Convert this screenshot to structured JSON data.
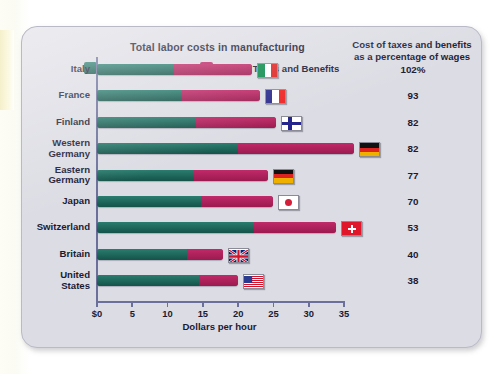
{
  "chart_title": "Total labor costs in manufacturing",
  "right_column_header": "Cost of taxes and benefits as a percentage of wages",
  "legend": [
    {
      "label": "Direct Pay",
      "color": "#1c6a5e",
      "key": "direct_pay"
    },
    {
      "label": "Payroll Taxes and Benefits",
      "color": "#b0215c",
      "key": "payroll_taxes"
    }
  ],
  "axis": {
    "xlabel": "Dollars per hour",
    "ticks": [
      "$0",
      "5",
      "10",
      "15",
      "20",
      "25",
      "30",
      "35"
    ],
    "tick_values": [
      0,
      5,
      10,
      15,
      20,
      25,
      30,
      35
    ],
    "min": 0,
    "max": 35
  },
  "chart_data": {
    "type": "bar",
    "orientation": "horizontal",
    "stacked": true,
    "title": "Total labor costs in manufacturing",
    "xlabel": "Dollars per hour",
    "ylabel": "",
    "xlim": [
      0,
      35
    ],
    "grid": false,
    "legend_position": "top",
    "categories": [
      "Italy",
      "France",
      "Finland",
      "Western Germany",
      "Eastern Germany",
      "Japan",
      "Switzerland",
      "Britain",
      "United States"
    ],
    "series": [
      {
        "name": "Direct Pay",
        "color": "#1c6a5e",
        "values": [
          10.9,
          12.0,
          14.0,
          20.0,
          13.7,
          14.7,
          22.2,
          12.8,
          14.5
        ]
      },
      {
        "name": "Payroll Taxes and Benefits",
        "color": "#b0215c",
        "values": [
          11.1,
          11.1,
          11.4,
          16.4,
          10.5,
          10.3,
          11.7,
          5.1,
          5.5
        ]
      }
    ],
    "totals": [
      22.0,
      23.1,
      25.4,
      36.4,
      24.2,
      25.0,
      33.9,
      17.9,
      20.0
    ],
    "annotations": {
      "label": "Cost of taxes and benefits as a percentage of wages",
      "values": [
        "102%",
        "93",
        "82",
        "82",
        "77",
        "70",
        "53",
        "40",
        "38"
      ]
    }
  },
  "rows": [
    {
      "country": "Italy",
      "country_lines": [
        "Italy"
      ],
      "direct": 10.9,
      "tax": 11.1,
      "pct": "102%",
      "flag": "italy"
    },
    {
      "country": "France",
      "country_lines": [
        "France"
      ],
      "direct": 12.0,
      "tax": 11.1,
      "pct": "93",
      "flag": "france"
    },
    {
      "country": "Finland",
      "country_lines": [
        "Finland"
      ],
      "direct": 14.0,
      "tax": 11.4,
      "pct": "82",
      "flag": "finland"
    },
    {
      "country": "Western Germany",
      "country_lines": [
        "Western",
        "Germany"
      ],
      "direct": 20.0,
      "tax": 16.4,
      "pct": "82",
      "flag": "germany"
    },
    {
      "country": "Eastern Germany",
      "country_lines": [
        "Eastern",
        "Germany"
      ],
      "direct": 13.7,
      "tax": 10.5,
      "pct": "77",
      "flag": "germany"
    },
    {
      "country": "Japan",
      "country_lines": [
        "Japan"
      ],
      "direct": 14.7,
      "tax": 10.3,
      "pct": "70",
      "flag": "japan"
    },
    {
      "country": "Switzerland",
      "country_lines": [
        "Switzerland"
      ],
      "direct": 22.2,
      "tax": 11.7,
      "pct": "53",
      "flag": "switzerland"
    },
    {
      "country": "Britain",
      "country_lines": [
        "Britain"
      ],
      "direct": 12.8,
      "tax": 5.1,
      "pct": "40",
      "flag": "uk"
    },
    {
      "country": "United States",
      "country_lines": [
        "United",
        "States"
      ],
      "direct": 14.5,
      "tax": 5.5,
      "pct": "38",
      "flag": "usa"
    }
  ],
  "colors": {
    "direct_pay": "#1c6a5e",
    "payroll_taxes": "#b0215c",
    "axis": "#6b6f9a",
    "card_background": "#dcdce4",
    "text": "#1a1a33"
  }
}
